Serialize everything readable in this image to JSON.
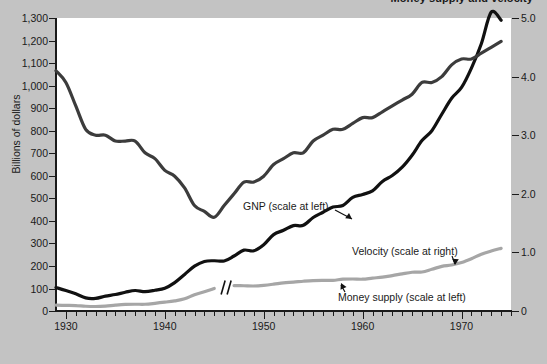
{
  "chart": {
    "title": "Money supply and velocity",
    "ylabel": "Billions of dollars",
    "xlabel": "",
    "annotations": {
      "gnp": "GNP (scale at left)",
      "velocity": "Velocity (scale at right)",
      "money_supply": "Money supply (scale at left)"
    }
  },
  "chart_data": {
    "type": "line",
    "title": "Money supply and velocity",
    "xlabel": "",
    "ylabel": "Billions of dollars",
    "y2label": "",
    "xlim": [
      1929,
      1975
    ],
    "ylim": [
      0,
      1300
    ],
    "y2lim": [
      0,
      5.0
    ],
    "grid": false,
    "legend": "annotations-on-curves",
    "yticks": [
      0,
      100,
      200,
      300,
      400,
      500,
      600,
      700,
      800,
      900,
      1000,
      1100,
      1200,
      1300
    ],
    "ytick_labels": [
      "0",
      "100",
      "200",
      "300",
      "400",
      "500",
      "600",
      "700",
      "800",
      "900",
      "1,000",
      "1,100",
      "1,200",
      "1,300"
    ],
    "xticks": [
      1930,
      1940,
      1950,
      1960,
      1970
    ],
    "xtick_labels": [
      "1930",
      "1940",
      "1950",
      "1960",
      "1970"
    ],
    "xminor_step": 1,
    "y2ticks": [
      0,
      1.0,
      2.0,
      3.0,
      4.0,
      5.0
    ],
    "y2tick_labels": [
      "0",
      "1.0",
      "2.0",
      "3.0",
      "4.0",
      "5.0"
    ],
    "series": [
      {
        "name": "GNP (scale at left)",
        "axis": "left",
        "color": "#111111",
        "width": 3.2,
        "x": [
          1929,
          1930,
          1931,
          1932,
          1933,
          1934,
          1935,
          1936,
          1937,
          1938,
          1939,
          1940,
          1941,
          1942,
          1943,
          1944,
          1945,
          1946,
          1947,
          1948,
          1949,
          1950,
          1951,
          1952,
          1953,
          1954,
          1955,
          1956,
          1957,
          1958,
          1959,
          1960,
          1961,
          1962,
          1963,
          1964,
          1965,
          1966,
          1967,
          1968,
          1969,
          1970,
          1971,
          1972,
          1973,
          1974
        ],
        "values": [
          104,
          91,
          76,
          58,
          56,
          66,
          73,
          83,
          91,
          86,
          92,
          101,
          126,
          162,
          199,
          220,
          223,
          222,
          244,
          270,
          267,
          294,
          339,
          358,
          379,
          380,
          415,
          438,
          461,
          468,
          504,
          517,
          533,
          575,
          601,
          638,
          691,
          756,
          800,
          873,
          944,
          992,
          1078,
          1186,
          1326,
          1290
        ]
      },
      {
        "name": "Velocity (scale at right)",
        "axis": "right",
        "color": "#3c3c3c",
        "width": 3.2,
        "x": [
          1929,
          1930,
          1931,
          1932,
          1933,
          1934,
          1935,
          1936,
          1937,
          1938,
          1939,
          1940,
          1941,
          1942,
          1943,
          1944,
          1945,
          1946,
          1947,
          1948,
          1949,
          1950,
          1951,
          1952,
          1953,
          1954,
          1955,
          1956,
          1957,
          1958,
          1959,
          1960,
          1961,
          1962,
          1963,
          1964,
          1965,
          1966,
          1967,
          1968,
          1969,
          1970,
          1971,
          1972,
          1973,
          1974
        ],
        "values": [
          4.1,
          3.9,
          3.5,
          3.1,
          3.0,
          3.0,
          2.9,
          2.9,
          2.9,
          2.7,
          2.6,
          2.4,
          2.3,
          2.1,
          1.8,
          1.7,
          1.6,
          1.8,
          2.0,
          2.2,
          2.2,
          2.3,
          2.5,
          2.6,
          2.7,
          2.7,
          2.9,
          3.0,
          3.1,
          3.1,
          3.2,
          3.3,
          3.3,
          3.4,
          3.5,
          3.6,
          3.7,
          3.9,
          3.9,
          4.0,
          4.2,
          4.3,
          4.3,
          4.4,
          4.5,
          4.6
        ]
      },
      {
        "name": "Money supply (scale at left)",
        "axis": "left",
        "color": "#a6a6a6",
        "width": 3.2,
        "break_at": 1946,
        "x": [
          1929,
          1930,
          1931,
          1932,
          1933,
          1934,
          1935,
          1936,
          1937,
          1938,
          1939,
          1940,
          1941,
          1942,
          1943,
          1944,
          1945,
          1946,
          1947,
          1948,
          1949,
          1950,
          1951,
          1952,
          1953,
          1954,
          1955,
          1956,
          1957,
          1958,
          1959,
          1960,
          1961,
          1962,
          1963,
          1964,
          1965,
          1966,
          1967,
          1968,
          1969,
          1970,
          1971,
          1972,
          1973,
          1974
        ],
        "values": [
          26,
          25,
          24,
          21,
          20,
          22,
          26,
          29,
          30,
          30,
          34,
          39,
          45,
          54,
          72,
          85,
          100,
          107,
          113,
          112,
          111,
          114,
          119,
          125,
          128,
          132,
          135,
          136,
          136,
          141,
          142,
          141,
          146,
          150,
          157,
          165,
          172,
          173,
          185,
          198,
          204,
          215,
          232,
          252,
          266,
          278
        ]
      }
    ]
  }
}
